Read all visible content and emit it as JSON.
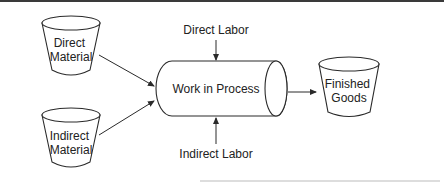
{
  "diagram": {
    "type": "flow",
    "nodes": {
      "direct_material": {
        "label_lines": [
          "Direct",
          "Material"
        ],
        "shape": "bucket"
      },
      "indirect_material": {
        "label_lines": [
          "Indirect",
          "Material"
        ],
        "shape": "bucket"
      },
      "work_in_process": {
        "label": "Work in Process",
        "shape": "horizontal-cylinder"
      },
      "finished_goods": {
        "label_lines": [
          "Finished",
          "Goods"
        ],
        "shape": "bucket"
      },
      "direct_labor": {
        "label": "Direct Labor",
        "shape": "text"
      },
      "indirect_labor": {
        "label": "Indirect Labor",
        "shape": "text"
      }
    },
    "edges": [
      {
        "from": "direct_material",
        "to": "work_in_process"
      },
      {
        "from": "indirect_material",
        "to": "work_in_process"
      },
      {
        "from": "direct_labor",
        "to": "work_in_process"
      },
      {
        "from": "indirect_labor",
        "to": "work_in_process"
      },
      {
        "from": "work_in_process",
        "to": "finished_goods"
      }
    ],
    "colors": {
      "line": "#2a2a2a",
      "text": "#222222",
      "top_border": "#3a3a3a",
      "bottom_rule": "#bbbbbb"
    }
  }
}
